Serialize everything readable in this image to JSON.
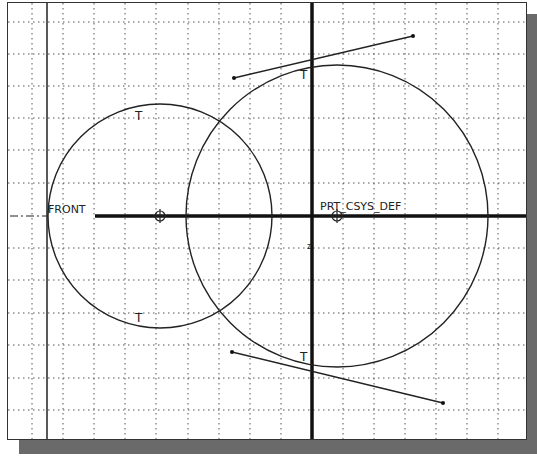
{
  "sketch": {
    "labels": {
      "front": "FRONT",
      "csys": "PRT_CSYS_DEF",
      "tangent": "T",
      "axis_marker": "z"
    },
    "grid_spacing_px": 31,
    "circles": [
      {
        "name": "small-circle",
        "cx": 160,
        "cy": 216,
        "r": 112
      },
      {
        "name": "large-circle",
        "cx": 337,
        "cy": 216,
        "r": 151
      }
    ],
    "tangent_lines": [
      {
        "name": "top-tangent-line",
        "x1": 234,
        "y1": 78,
        "x2": 413,
        "y2": 36
      },
      {
        "name": "bottom-tangent-line",
        "x1": 232,
        "y1": 352,
        "x2": 443,
        "y2": 403
      }
    ],
    "colors": {
      "ink": "#222222",
      "grid": "#555555",
      "shadow": "#6a6a6a"
    }
  }
}
